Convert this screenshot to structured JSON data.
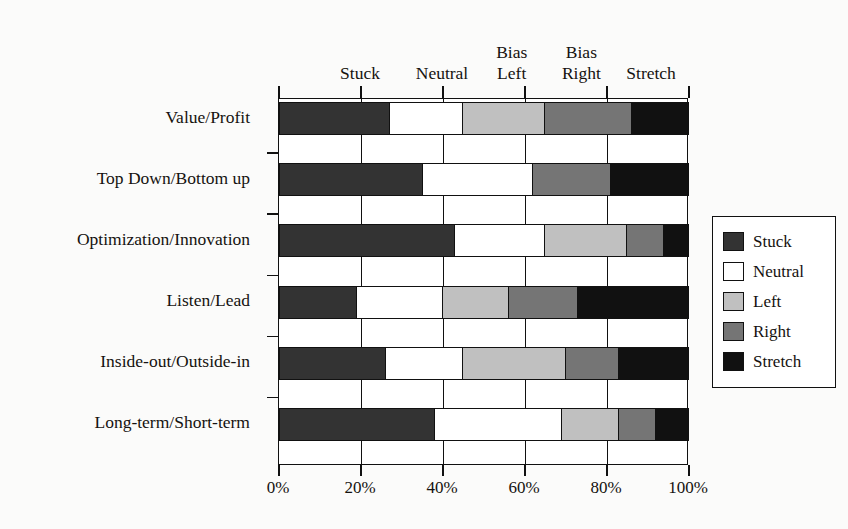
{
  "chart_data": {
    "type": "bar",
    "orientation": "horizontal",
    "stacked": true,
    "normalized": true,
    "title": "",
    "xlabel": "",
    "ylabel": "",
    "xlim": [
      0,
      100
    ],
    "xticks": [
      "0%",
      "20%",
      "40%",
      "60%",
      "80%",
      "100%"
    ],
    "xtick_values": [
      0,
      20,
      40,
      60,
      80,
      100
    ],
    "grid": true,
    "legend_position": "right",
    "categories": [
      "Value/Profit",
      "Top Down/Bottom up",
      "Optimization/Innovation",
      "Listen/Lead",
      "Inside-out/Outside-in",
      "Long-term/Short-term"
    ],
    "series": [
      {
        "name": "Stuck",
        "color": "#333333",
        "values": [
          27,
          35,
          43,
          19,
          26,
          38
        ]
      },
      {
        "name": "Neutral",
        "color": "#ffffff",
        "values": [
          18,
          27,
          22,
          21,
          19,
          31
        ]
      },
      {
        "name": "Left",
        "color": "#c0c0c0",
        "values": [
          20,
          0,
          20,
          16,
          25,
          14
        ]
      },
      {
        "name": "Right",
        "color": "#757575",
        "values": [
          21,
          19,
          9,
          17,
          13,
          9
        ]
      },
      {
        "name": "Stretch",
        "color": "#111111",
        "values": [
          14,
          19,
          6,
          27,
          17,
          8
        ]
      }
    ],
    "column_headers": [
      "Stuck",
      "Neutral",
      "Bias\nLeft",
      "Bias\nRight",
      "Stretch"
    ],
    "column_header_centers": [
      20,
      40,
      57,
      74,
      91
    ],
    "legend": {
      "items": [
        {
          "label": "Stuck",
          "color": "#333333"
        },
        {
          "label": "Neutral",
          "color": "#ffffff"
        },
        {
          "label": "Left",
          "color": "#c0c0c0"
        },
        {
          "label": "Right",
          "color": "#757575"
        },
        {
          "label": "Stretch",
          "color": "#111111"
        }
      ]
    }
  }
}
